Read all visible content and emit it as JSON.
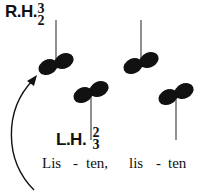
{
  "right_hand": {
    "label": "R.H.",
    "finger_top": "3",
    "finger_bottom": "2"
  },
  "left_hand": {
    "label": "L.H.",
    "finger_top": "2",
    "finger_bottom": "3"
  },
  "lyrics": {
    "syllable_1": "Lis",
    "dash_1": "-",
    "syllable_2": "ten,",
    "syllable_3": "lis",
    "dash_2": "-",
    "syllable_4": "ten"
  },
  "notes": [
    {
      "hand": "right",
      "type": "interval-pair",
      "stem": "up"
    },
    {
      "hand": "left",
      "type": "interval-pair",
      "stem": "down"
    },
    {
      "hand": "right",
      "type": "interval-pair",
      "stem": "up"
    },
    {
      "hand": "left",
      "type": "interval-pair",
      "stem": "down"
    }
  ],
  "colors": {
    "ink": "#111111",
    "stem": "#555555",
    "background": "#ffffff"
  }
}
